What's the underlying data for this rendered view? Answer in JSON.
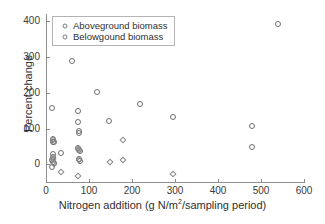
{
  "chart_data": {
    "type": "scatter",
    "title": "",
    "xlabel": "Nitrogen addition (g N/m2/sampling period)",
    "xlabel_parts": {
      "before": "Nitrogen addition (g N/m",
      "superscript": "2",
      "after": "/sampling period)"
    },
    "ylabel": "Percent change",
    "xlim": [
      0,
      600
    ],
    "ylim": [
      -52,
      420
    ],
    "xticks": [
      0,
      100,
      200,
      300,
      400,
      500,
      600
    ],
    "yticks": [
      0,
      100,
      200,
      300,
      400
    ],
    "xticklabels": [
      "0",
      "100",
      "200",
      "300",
      "400",
      "500",
      "600"
    ],
    "yticklabels": [
      "0",
      "100",
      "200",
      "300",
      "400"
    ],
    "grid": false,
    "legend_position": "top-left",
    "series": [
      {
        "name": "Aboveground biomass",
        "marker": "circle",
        "color": "#6f6f6f",
        "points": [
          [
            14,
            157
          ],
          [
            16,
            70
          ],
          [
            17,
            63
          ],
          [
            18,
            62
          ],
          [
            16,
            30
          ],
          [
            17,
            22
          ],
          [
            15,
            12
          ],
          [
            16,
            8
          ],
          [
            18,
            5
          ],
          [
            14,
            -7
          ],
          [
            34,
            33
          ],
          [
            60,
            290
          ],
          [
            74,
            150
          ],
          [
            75,
            118
          ],
          [
            76,
            92
          ],
          [
            77,
            88
          ],
          [
            74,
            45
          ],
          [
            76,
            41
          ],
          [
            78,
            38
          ],
          [
            77,
            14
          ],
          [
            78,
            10
          ],
          [
            118,
            201
          ],
          [
            147,
            120
          ],
          [
            218,
            170
          ],
          [
            296,
            131
          ],
          [
            478,
            106
          ],
          [
            480,
            48
          ],
          [
            540,
            392
          ]
        ]
      },
      {
        "name": "Belowgound biomass",
        "marker": "diamond",
        "color": "#8a8a8a",
        "points": [
          [
            16,
            68
          ],
          [
            17,
            20
          ],
          [
            16,
            14
          ],
          [
            18,
            2
          ],
          [
            36,
            -20
          ],
          [
            74,
            43
          ],
          [
            76,
            40
          ],
          [
            76,
            12
          ],
          [
            75,
            -32
          ],
          [
            148,
            6
          ],
          [
            178,
            67
          ],
          [
            180,
            11
          ],
          [
            295,
            -28
          ]
        ]
      }
    ]
  },
  "legend": {
    "items": [
      {
        "label": "Aboveground biomass"
      },
      {
        "label": "Belowgound biomass"
      }
    ]
  }
}
